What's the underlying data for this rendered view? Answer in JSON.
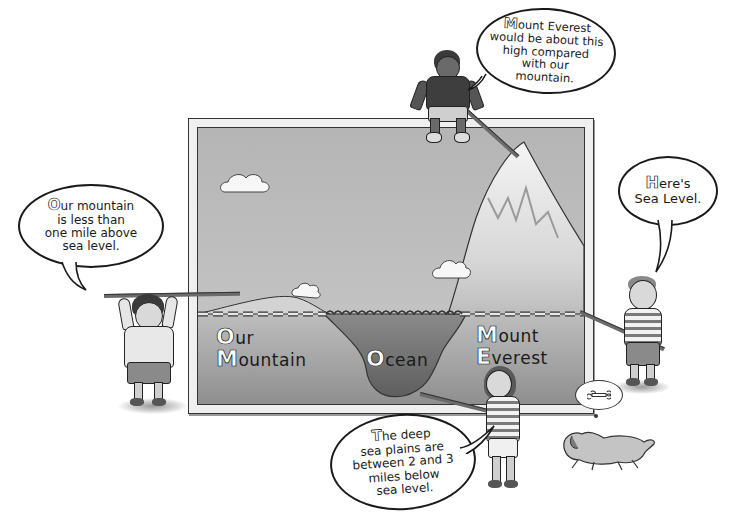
{
  "scene": {
    "description": "Illustrated comparison of ocean depth and mountain heights",
    "colors": {
      "sky": "#b9b9b9",
      "underground": "#a9a9a9",
      "ocean": "#7c7c7c",
      "frame": "#efefef",
      "ink": "#1a1a1a"
    }
  },
  "bubbles": {
    "everest": {
      "initial": "M",
      "text": "ount Everest\nwould be about this\nhigh compared\nwith our\nmountain.",
      "inner_initial": "E"
    },
    "our_mountain": {
      "initial": "O",
      "text": "ur mountain\nis less than\none mile above\nsea level."
    },
    "sea_level": {
      "initial": "H",
      "text": "ere's\nSea Level."
    },
    "deep_sea": {
      "initial": "T",
      "text": "he deep\nsea plains are\nbetween 2 and 3\nmiles below\nsea level."
    }
  },
  "diagram_labels": {
    "our_mountain": {
      "line1_initial": "O",
      "line1": "ur",
      "line2_initial": "M",
      "line2": "ountain"
    },
    "ocean": {
      "initial": "O",
      "text": "cean"
    },
    "everest": {
      "line1_initial": "M",
      "line1": "ount",
      "line2_initial": "E",
      "line2": "verest"
    }
  },
  "dog_thought": {
    "icon": "bone-icon"
  }
}
